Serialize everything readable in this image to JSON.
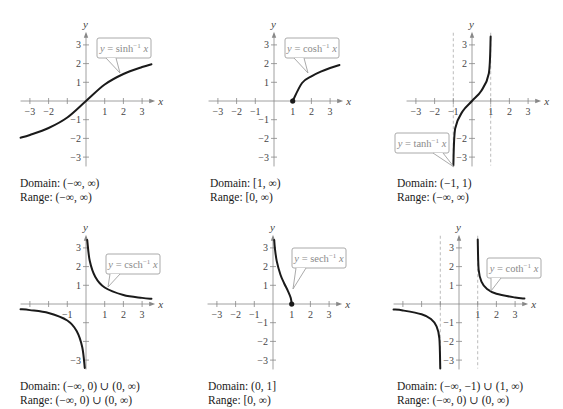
{
  "chart_data": [
    {
      "type": "line",
      "id": "asinh",
      "function_label": "y = sinh⁻¹ x",
      "label_parts": {
        "pre": "y = sinh",
        "sup": "−1",
        "post": " x"
      },
      "xlabel": "x",
      "ylabel": "y",
      "x_ticks": [
        -3,
        -2,
        -1,
        1,
        2,
        3
      ],
      "x_tick_labels": [
        "−3",
        "−2",
        "",
        "1",
        "2",
        "3"
      ],
      "y_ticks": [
        -3,
        -2,
        -1,
        1,
        2,
        3
      ],
      "y_tick_labels": [
        "−3",
        "−2",
        "−1",
        "1",
        "2",
        "3"
      ],
      "xlim": [
        -3.5,
        3.7
      ],
      "ylim": [
        -3.5,
        3.7
      ],
      "asymptotes_x": [],
      "points": [
        [
          -3.5,
          -1.9657
        ],
        [
          -3,
          -1.8184
        ],
        [
          -2,
          -1.4436
        ],
        [
          -1,
          -0.8814
        ],
        [
          0,
          0
        ],
        [
          1,
          0.8814
        ],
        [
          2,
          1.4436
        ],
        [
          3,
          1.8184
        ],
        [
          3.5,
          1.9657
        ]
      ],
      "endpoint_dots": [],
      "domain": "Domain:  (−∞, ∞)",
      "range": "Range:  (−∞, ∞)"
    },
    {
      "type": "line",
      "id": "acosh",
      "function_label": "y = cosh⁻¹ x",
      "label_parts": {
        "pre": "y = cosh",
        "sup": "−1",
        "post": " x"
      },
      "xlabel": "x",
      "ylabel": "y",
      "x_ticks": [
        -3,
        -2,
        -1,
        1,
        2,
        3
      ],
      "x_tick_labels": [
        "−3",
        "−2",
        "−1",
        "1",
        "2",
        "3"
      ],
      "y_ticks": [
        -3,
        -2,
        -1,
        1,
        2,
        3
      ],
      "y_tick_labels": [
        "−3",
        "−2",
        "−1",
        "1",
        "2",
        "3"
      ],
      "xlim": [
        -3.5,
        3.7
      ],
      "ylim": [
        -3.5,
        3.7
      ],
      "asymptotes_x": [],
      "points": [
        [
          1,
          0
        ],
        [
          1.5,
          0.9624
        ],
        [
          2,
          1.317
        ],
        [
          2.5,
          1.5668
        ],
        [
          3,
          1.7627
        ],
        [
          3.5,
          1.9248
        ]
      ],
      "endpoint_dots": [
        [
          1,
          0
        ]
      ],
      "domain": "Domain:  [1, ∞)",
      "range": "Range:  [0, ∞)"
    },
    {
      "type": "line",
      "id": "atanh",
      "function_label": "y = tanh⁻¹ x",
      "label_parts": {
        "pre": "y = tanh",
        "sup": "−1",
        "post": " x"
      },
      "xlabel": "x",
      "ylabel": "y",
      "x_ticks": [
        -3,
        -2,
        -1,
        1,
        2,
        3
      ],
      "x_tick_labels": [
        "−3",
        "−2",
        "−1",
        "1",
        "2",
        "3"
      ],
      "y_ticks": [
        -3,
        -2,
        -1,
        1,
        2,
        3
      ],
      "y_tick_labels": [
        "−3",
        "−2",
        "",
        "",
        "2",
        "3"
      ],
      "xlim": [
        -3.5,
        3.7
      ],
      "ylim": [
        -3.5,
        3.7
      ],
      "asymptotes_x": [
        -1,
        1
      ],
      "points": [
        [
          -0.998,
          -3.45
        ],
        [
          -0.9,
          -1.4722
        ],
        [
          -0.5,
          -0.5493
        ],
        [
          0,
          0
        ],
        [
          0.5,
          0.5493
        ],
        [
          0.9,
          1.4722
        ],
        [
          0.998,
          3.45
        ]
      ],
      "endpoint_dots": [],
      "domain": "Domain:  (−1, 1)",
      "range": "Range:  (−∞, ∞)"
    },
    {
      "type": "line",
      "id": "acsch",
      "function_label": "y = csch⁻¹ x",
      "label_parts": {
        "pre": "y = csch",
        "sup": "−1",
        "post": " x"
      },
      "xlabel": "x",
      "ylabel": "y",
      "x_ticks": [
        -3,
        -2,
        -1,
        1,
        2,
        3
      ],
      "x_tick_labels": [
        "",
        "",
        "−1",
        "1",
        "2",
        "3"
      ],
      "y_ticks": [
        -3,
        -2,
        -1,
        1,
        2,
        3
      ],
      "y_tick_labels": [
        "−3",
        "",
        "",
        "1",
        "2",
        "3"
      ],
      "xlim": [
        -3.5,
        3.7
      ],
      "ylim": [
        -3.5,
        3.7
      ],
      "asymptotes_x": [],
      "points_neg": [
        [
          -3.5,
          -0.2812
        ],
        [
          -3,
          -0.3275
        ],
        [
          -2,
          -0.4812
        ],
        [
          -1,
          -0.8814
        ],
        [
          -0.5,
          -1.4436
        ],
        [
          -0.2,
          -2.3124
        ],
        [
          -0.065,
          -3.42
        ]
      ],
      "points": [
        [
          0.065,
          3.42
        ],
        [
          0.2,
          2.3124
        ],
        [
          0.5,
          1.4436
        ],
        [
          1,
          0.8814
        ],
        [
          2,
          0.4812
        ],
        [
          3,
          0.3275
        ],
        [
          3.5,
          0.2812
        ]
      ],
      "endpoint_dots": [],
      "domain": "Domain:  (−∞, 0) ∪ (0, ∞)",
      "range": "Range:  (−∞, 0) ∪ (0, ∞)"
    },
    {
      "type": "line",
      "id": "asech",
      "function_label": "y = sech⁻¹ x",
      "label_parts": {
        "pre": "y = sech",
        "sup": "−1",
        "post": " x"
      },
      "xlabel": "x",
      "ylabel": "y",
      "x_ticks": [
        -3,
        -2,
        -1,
        1,
        2,
        3
      ],
      "x_tick_labels": [
        "−3",
        "−2",
        "−1",
        "1",
        "2",
        "3"
      ],
      "y_ticks": [
        -3,
        -2,
        -1,
        1,
        2,
        3
      ],
      "y_tick_labels": [
        "−3",
        "−2",
        "−1",
        "1",
        "2",
        "3"
      ],
      "xlim": [
        -3.5,
        3.7
      ],
      "ylim": [
        -3.5,
        3.7
      ],
      "asymptotes_x": [],
      "points": [
        [
          0.065,
          3.42
        ],
        [
          0.1,
          2.9932
        ],
        [
          0.2,
          2.2924
        ],
        [
          0.4,
          1.5668
        ],
        [
          0.6,
          1.0986
        ],
        [
          0.8,
          0.6931
        ],
        [
          0.95,
          0.3222
        ],
        [
          1,
          0
        ]
      ],
      "endpoint_dots": [
        [
          1,
          0
        ]
      ],
      "domain": "Domain:  (0, 1]",
      "range": "Range:  [0, ∞)"
    },
    {
      "type": "line",
      "id": "acoth",
      "function_label": "y = coth⁻¹ x",
      "label_parts": {
        "pre": "y = coth",
        "sup": "−1",
        "post": " x"
      },
      "xlabel": "x",
      "ylabel": "y",
      "x_ticks": [
        -3,
        -2,
        -1,
        1,
        2,
        3
      ],
      "x_tick_labels": [
        "",
        "",
        "",
        "1",
        "2",
        "3"
      ],
      "y_ticks": [
        -3,
        -2,
        -1,
        1,
        2,
        3
      ],
      "y_tick_labels": [
        "−3",
        "−2",
        "−1",
        "1",
        "2",
        "3"
      ],
      "xlim": [
        -3.5,
        3.7
      ],
      "ylim": [
        -3.5,
        3.7
      ],
      "asymptotes_x": [
        -1,
        1
      ],
      "points_neg": [
        [
          -3.5,
          -0.2939
        ],
        [
          -3,
          -0.3466
        ],
        [
          -2,
          -0.5493
        ],
        [
          -1.5,
          -0.8047
        ],
        [
          -1.2,
          -1.1989
        ],
        [
          -1.05,
          -1.8444
        ],
        [
          -1.002,
          -3.45
        ]
      ],
      "points": [
        [
          1.002,
          3.45
        ],
        [
          1.05,
          1.8444
        ],
        [
          1.2,
          1.1989
        ],
        [
          1.5,
          0.8047
        ],
        [
          2,
          0.5493
        ],
        [
          3,
          0.3466
        ],
        [
          3.5,
          0.2939
        ]
      ],
      "endpoint_dots": [],
      "domain": "Domain:  (−∞, −1) ∪ (1, ∞)",
      "range": "Range:  (−∞, 0) ∪ (0, ∞)"
    }
  ],
  "layout": {
    "unit_px": 18.7,
    "panels": [
      {
        "ox": 86,
        "oy": 101,
        "label_box": [
          97,
          38,
          54,
          20
        ],
        "label_tail": [
          120,
          73
        ],
        "caption_x": 20,
        "caption_y": 176
      },
      {
        "ox": 274,
        "oy": 101,
        "label_box": [
          285,
          38,
          54,
          20
        ],
        "label_tail": [
          308,
          73
        ],
        "caption_x": 210,
        "caption_y": 176
      },
      {
        "ox": 472,
        "oy": 101,
        "label_box": [
          395,
          133,
          54,
          20
        ],
        "label_tail": [
          454,
          167
        ],
        "caption_x": 397,
        "caption_y": 176
      },
      {
        "ox": 86,
        "oy": 304,
        "label_box": [
          106,
          254,
          54,
          20
        ],
        "label_tail": [
          108,
          287
        ],
        "caption_x": 20,
        "caption_y": 379
      },
      {
        "ox": 273,
        "oy": 304,
        "label_box": [
          292,
          248,
          54,
          20
        ],
        "label_tail": [
          293,
          289
        ],
        "caption_x": 208,
        "caption_y": 379
      },
      {
        "ox": 459,
        "oy": 304,
        "label_box": [
          487,
          258,
          54,
          20
        ],
        "label_tail": [
          491,
          291
        ],
        "caption_x": 397,
        "caption_y": 379
      }
    ]
  },
  "colors": {
    "curve": "#1a1a1a",
    "axis": "#888888",
    "asymptote": "#a9a9a9",
    "label_border": "#a0a0a0",
    "label_text": "#8a8a8a",
    "tick_text": "#444444"
  }
}
